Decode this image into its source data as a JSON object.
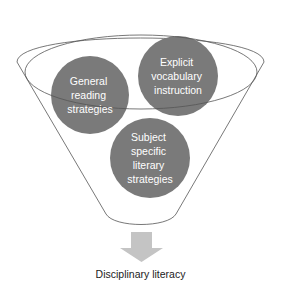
{
  "diagram": {
    "type": "funnel",
    "colors": {
      "circle_fill": "#7a7a7a",
      "outline": "#555555",
      "arrow_fill": "#c4c4c4",
      "circle_text": "#ffffff",
      "label_text": "#222222"
    },
    "inputs": [
      {
        "id": "general",
        "lines": [
          "General",
          "reading",
          "strategies"
        ]
      },
      {
        "id": "vocab",
        "lines": [
          "Explicit",
          "vocabulary",
          "instruction"
        ]
      },
      {
        "id": "subject",
        "lines": [
          "Subject",
          "specific",
          "literary",
          "strategies"
        ]
      }
    ],
    "output": {
      "label": "Disciplinary literacy"
    }
  }
}
